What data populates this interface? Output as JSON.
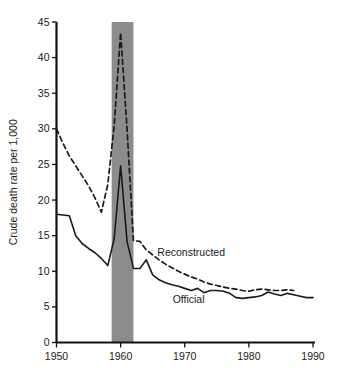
{
  "chart_data": {
    "type": "line",
    "title": "",
    "subtitle": "",
    "xlabel": "",
    "ylabel": "Crude death rate per 1,000",
    "xlim": [
      1950,
      1990
    ],
    "ylim": [
      0,
      45
    ],
    "grid": false,
    "legend_position": "inline-annotation",
    "x_ticks": [
      1950,
      1960,
      1970,
      1980,
      1990
    ],
    "x_tick_labels": [
      "1950",
      "1960",
      "1970",
      "1980",
      "1990"
    ],
    "y_ticks": [
      0,
      5,
      10,
      15,
      20,
      25,
      30,
      35,
      40,
      45
    ],
    "y_tick_labels": [
      "0",
      "5",
      "10",
      "15",
      "20",
      "25",
      "30",
      "35",
      "40",
      "45"
    ],
    "annotations": [
      {
        "text": "Reconstructed",
        "x": 1971.0,
        "y": 12.2
      },
      {
        "text": "Official",
        "x": 1970.6,
        "y": 5.6
      }
    ],
    "shaded_region": {
      "label": "",
      "color": "#8c8c8c",
      "x_start": 1958.6,
      "x_end": 1962.0,
      "y_start": 0,
      "y_end": 45
    },
    "series": [
      {
        "name": "Reconstructed",
        "style": "dashed",
        "color": "#1a1a1a",
        "x": [
          1950,
          1951,
          1952,
          1953,
          1954,
          1955,
          1956,
          1957,
          1958,
          1959,
          1960,
          1961,
          1962,
          1963,
          1964,
          1965,
          1966,
          1967,
          1968,
          1969,
          1970,
          1971,
          1972,
          1973,
          1974,
          1975,
          1976,
          1977,
          1978,
          1979,
          1980,
          1981,
          1982,
          1983,
          1984,
          1985,
          1986,
          1987
        ],
        "values": [
          30.0,
          28.0,
          26.2,
          24.8,
          23.4,
          22.0,
          20.3,
          18.3,
          22.2,
          30.5,
          43.5,
          30.0,
          14.3,
          14.2,
          13.0,
          12.3,
          11.6,
          11.0,
          10.5,
          10.0,
          9.6,
          9.2,
          8.9,
          8.5,
          8.2,
          8.0,
          7.8,
          7.6,
          7.5,
          7.3,
          7.2,
          7.4,
          7.5,
          7.4,
          7.3,
          7.3,
          7.4,
          7.3
        ]
      },
      {
        "name": "Official",
        "style": "solid",
        "color": "#1a1a1a",
        "x": [
          1950,
          1951,
          1952,
          1953,
          1954,
          1955,
          1956,
          1957,
          1958,
          1959,
          1960,
          1961,
          1962,
          1963,
          1964,
          1965,
          1966,
          1967,
          1968,
          1969,
          1970,
          1971,
          1972,
          1973,
          1974,
          1975,
          1976,
          1977,
          1978,
          1979,
          1980,
          1981,
          1982,
          1983,
          1984,
          1985,
          1986,
          1987,
          1988,
          1989,
          1990
        ],
        "values": [
          18.0,
          17.9,
          17.8,
          15.0,
          13.9,
          13.2,
          12.6,
          11.8,
          10.8,
          14.6,
          24.8,
          14.2,
          10.4,
          10.4,
          11.6,
          9.5,
          8.8,
          8.4,
          8.1,
          7.9,
          7.6,
          7.3,
          7.6,
          7.0,
          7.3,
          7.3,
          7.2,
          6.9,
          6.3,
          6.2,
          6.3,
          6.4,
          6.6,
          7.1,
          6.8,
          6.6,
          6.9,
          6.7,
          6.5,
          6.3,
          6.3
        ]
      }
    ]
  },
  "axes": {
    "y_axis_title": "Crude death rate per 1,000"
  }
}
